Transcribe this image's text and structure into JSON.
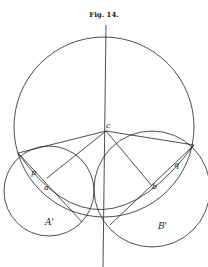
{
  "figure": {
    "title": "Fig. 14.",
    "labels": {
      "c": "c",
      "p": "p",
      "q": "q",
      "a": "a",
      "b": "b",
      "A_prime": "A'",
      "B_prime": "B'"
    },
    "colors": {
      "ink": "#222222",
      "paper": "#ffffff"
    }
  }
}
